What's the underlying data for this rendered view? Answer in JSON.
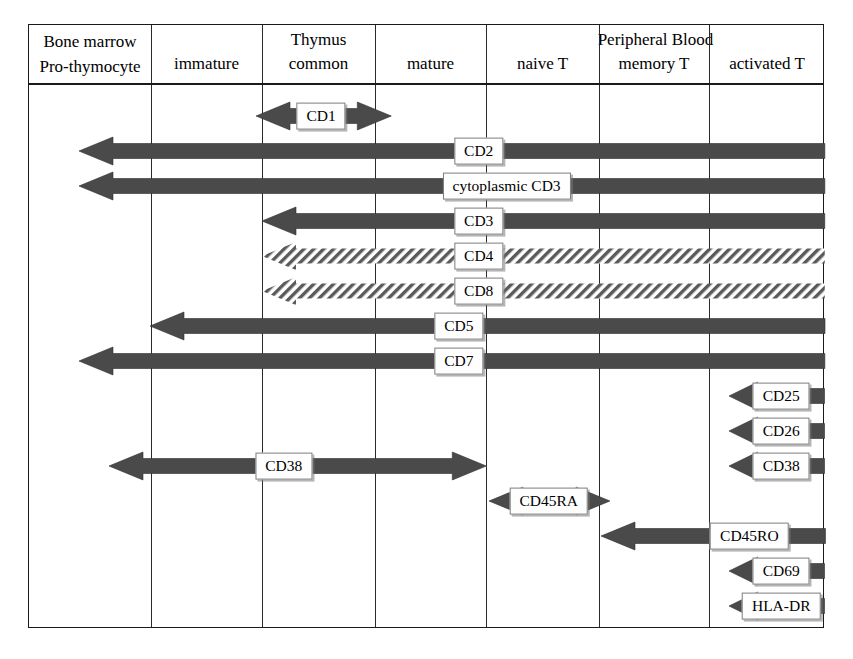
{
  "diagram": {
    "colors": {
      "arrow_fill": "#4a4a4a",
      "arrow_outline": "#2e2e2e",
      "hatch_fill": "#5a5a5a",
      "grid": "#2a2a2a",
      "border": "#1a1a1a",
      "label_box": "#fefefe"
    },
    "header": {
      "groups": [
        {
          "label": "Thymus",
          "start_col": 1,
          "end_col": 3
        },
        {
          "label": "Peripheral Blood",
          "start_col": 4,
          "end_col": 6
        }
      ],
      "columns": [
        {
          "id": "bone-marrow",
          "line1": "Bone marrow",
          "line2": "Pro-thymocyte",
          "lines": 2
        },
        {
          "id": "immature",
          "line1": "immature",
          "lines": 1
        },
        {
          "id": "common",
          "line1": "common",
          "lines": 1
        },
        {
          "id": "mature",
          "line1": "mature",
          "lines": 1
        },
        {
          "id": "naive-t",
          "line1": "naive T",
          "lines": 1
        },
        {
          "id": "memory-t",
          "line1": "memory T",
          "lines": 1
        },
        {
          "id": "activated-t",
          "line1": "activated T",
          "lines": 1
        }
      ]
    },
    "markers": [
      {
        "id": "cd1",
        "label": "CD1",
        "style": "solid",
        "left_head": true,
        "right_head": true,
        "start": 0.285,
        "end": 0.455,
        "label_pos": 0.367,
        "label_anchor": "center"
      },
      {
        "id": "cd2",
        "label": "CD2",
        "style": "solid",
        "left_head": true,
        "right_head": false,
        "start": 0.063,
        "end": 1.0,
        "label_pos": 0.565,
        "label_anchor": "center"
      },
      {
        "id": "ccd3",
        "label": "cytoplasmic CD3",
        "style": "solid",
        "left_head": true,
        "right_head": false,
        "start": 0.063,
        "end": 1.0,
        "label_pos": 0.6,
        "label_anchor": "center"
      },
      {
        "id": "cd3",
        "label": "CD3",
        "style": "solid",
        "left_head": true,
        "right_head": false,
        "start": 0.293,
        "end": 1.0,
        "label_pos": 0.565,
        "label_anchor": "center"
      },
      {
        "id": "cd4",
        "label": "CD4",
        "style": "hatch",
        "left_head": true,
        "right_head": false,
        "start": 0.293,
        "end": 1.0,
        "label_pos": 0.565,
        "label_anchor": "center"
      },
      {
        "id": "cd8",
        "label": "CD8",
        "style": "hatch",
        "left_head": true,
        "right_head": false,
        "start": 0.293,
        "end": 1.0,
        "label_pos": 0.565,
        "label_anchor": "center"
      },
      {
        "id": "cd5",
        "label": "CD5",
        "style": "solid",
        "left_head": true,
        "right_head": false,
        "start": 0.152,
        "end": 1.0,
        "label_pos": 0.54,
        "label_anchor": "center"
      },
      {
        "id": "cd7",
        "label": "CD7",
        "style": "solid",
        "left_head": true,
        "right_head": false,
        "start": 0.063,
        "end": 1.0,
        "label_pos": 0.54,
        "label_anchor": "center"
      },
      {
        "id": "cd25",
        "label": "CD25",
        "style": "solid",
        "left_head": true,
        "right_head": false,
        "start": 0.88,
        "end": 1.0,
        "label_pos": 0.945,
        "label_anchor": "center"
      },
      {
        "id": "cd26",
        "label": "CD26",
        "style": "solid",
        "left_head": true,
        "right_head": false,
        "start": 0.88,
        "end": 1.0,
        "label_pos": 0.945,
        "label_anchor": "center"
      },
      {
        "id": "cd38b",
        "label": "CD38",
        "style": "solid",
        "left_head": true,
        "right_head": false,
        "start": 0.88,
        "end": 1.0,
        "label_pos": 0.945,
        "label_anchor": "center"
      },
      {
        "id": "cd38a",
        "label": "CD38",
        "style": "solid",
        "left_head": true,
        "right_head": true,
        "start": 0.1,
        "end": 0.574,
        "label_pos": 0.32,
        "label_anchor": "center"
      },
      {
        "id": "cd45ra",
        "label": "CD45RA",
        "style": "solid",
        "left_head": true,
        "right_head": true,
        "start": 0.578,
        "end": 0.73,
        "label_pos": 0.653,
        "label_anchor": "center"
      },
      {
        "id": "cd45ro",
        "label": "CD45RO",
        "style": "solid",
        "left_head": true,
        "right_head": false,
        "start": 0.718,
        "end": 1.0,
        "label_pos": 0.905,
        "label_anchor": "center"
      },
      {
        "id": "cd69",
        "label": "CD69",
        "style": "solid",
        "left_head": true,
        "right_head": false,
        "start": 0.88,
        "end": 1.0,
        "label_pos": 0.945,
        "label_anchor": "center"
      },
      {
        "id": "hladr",
        "label": "HLA-DR",
        "style": "solid",
        "left_head": true,
        "right_head": false,
        "start": 0.88,
        "end": 1.0,
        "label_pos": 0.945,
        "label_anchor": "center"
      }
    ],
    "row_tops": [
      74,
      109,
      144,
      179,
      214,
      249,
      284,
      319,
      354,
      389,
      424,
      424,
      459,
      494,
      529,
      564
    ],
    "column_edges": [
      0,
      122,
      233,
      346,
      457,
      570,
      680,
      796
    ]
  }
}
